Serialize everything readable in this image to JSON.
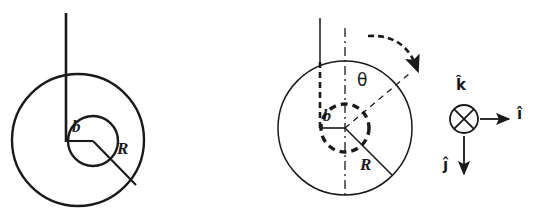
{
  "figure": {
    "background_color": "#ffffff",
    "stroke_color": "#1a1a1a",
    "width": 542,
    "height": 212
  },
  "panel_left": {
    "name": "initial-configuration",
    "outer_circle": {
      "cx": 78,
      "cy": 140,
      "r": 66,
      "style": "solid"
    },
    "inner_circle": {
      "cx": 93,
      "cy": 141,
      "r": 25,
      "style": "solid"
    },
    "string": {
      "x": 66,
      "y_top": 13,
      "y_bottom": 141,
      "style": "solid"
    },
    "labels": {
      "inner_radius": "b",
      "outer_radius": "R"
    },
    "radius_line_R": {
      "x1": 93,
      "y1": 141,
      "x2": 136,
      "y2": 185
    },
    "radius_line_b": {
      "x1": 66,
      "y1": 141,
      "x2": 93,
      "y2": 141
    }
  },
  "panel_right": {
    "name": "rotated-configuration",
    "outer_circle": {
      "cx": 345,
      "cy": 128,
      "r": 67,
      "style": "solid"
    },
    "inner_circle": {
      "cx": 345,
      "cy": 128,
      "r": 24,
      "style": "dashed"
    },
    "string": {
      "x": 320,
      "y_top": 18,
      "y_bottom": 128,
      "style": "solid"
    },
    "vertical_axis": {
      "x": 345,
      "y_top": 28,
      "y_bottom": 196,
      "style": "dash-dot"
    },
    "angle_line": {
      "x1": 345,
      "y1": 128,
      "x2": 409,
      "y2": 74,
      "style": "dashed"
    },
    "rotation_arrow": {
      "style": "dashed-curved",
      "direction": "clockwise"
    },
    "labels": {
      "angle": "θ",
      "inner_radius": "b",
      "outer_radius": "R"
    },
    "radius_line_R": {
      "x1": 345,
      "y1": 128,
      "x2": 392,
      "y2": 175
    },
    "radius_line_b": {
      "x1": 320,
      "y1": 128,
      "x2": 345,
      "y2": 128
    }
  },
  "unit_vector_triad": {
    "name": "coordinate-axes",
    "origin": {
      "cx": 464,
      "cy": 119,
      "r": 14
    },
    "k_hat": {
      "label": "k̂",
      "symbol": "into-page",
      "glyph": "⊗"
    },
    "i_hat": {
      "label": "î",
      "direction": "right",
      "x1": 480,
      "y1": 119,
      "x2": 512,
      "y2": 119
    },
    "j_hat": {
      "label": "ĵ",
      "direction": "down",
      "x1": 464,
      "y1": 136,
      "x2": 464,
      "y2": 178
    }
  }
}
